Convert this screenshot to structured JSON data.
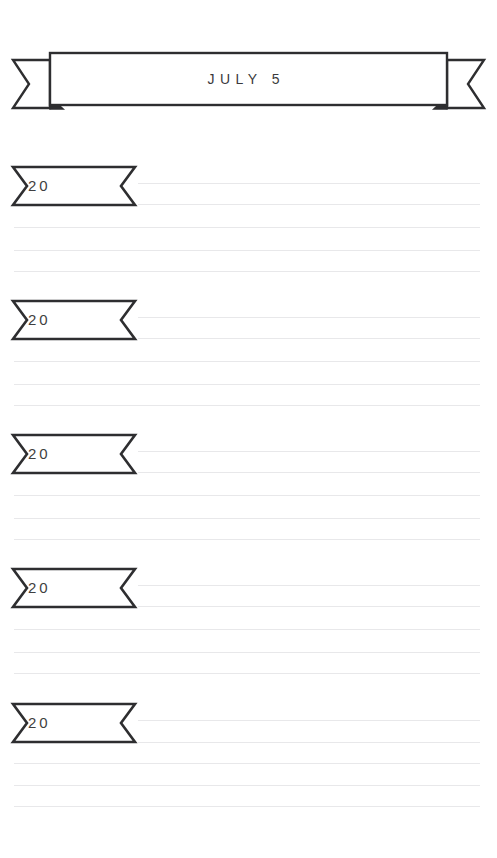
{
  "page": {
    "background_color": "#ffffff",
    "ink_color": "#2e2e30",
    "rule_color": "#e8e8ea",
    "width": 497,
    "height": 858
  },
  "header": {
    "title": "JULY 5",
    "icon": "ribbon-banner-icon",
    "shape": "swallowtail-ribbon"
  },
  "entries": [
    {
      "year_prefix": "20",
      "icon": "ribbon-tag-icon",
      "top": 165,
      "rules": [
        {
          "y": 18,
          "style": "indented"
        },
        {
          "y": 39,
          "style": "indented"
        },
        {
          "y": 62,
          "style": "full"
        },
        {
          "y": 85,
          "style": "full"
        },
        {
          "y": 106,
          "style": "full"
        }
      ]
    },
    {
      "year_prefix": "20",
      "icon": "ribbon-tag-icon",
      "top": 299,
      "rules": [
        {
          "y": 18,
          "style": "indented"
        },
        {
          "y": 39,
          "style": "indented"
        },
        {
          "y": 62,
          "style": "full"
        },
        {
          "y": 85,
          "style": "full"
        },
        {
          "y": 106,
          "style": "full"
        }
      ]
    },
    {
      "year_prefix": "20",
      "icon": "ribbon-tag-icon",
      "top": 433,
      "rules": [
        {
          "y": 18,
          "style": "indented"
        },
        {
          "y": 39,
          "style": "indented"
        },
        {
          "y": 62,
          "style": "full"
        },
        {
          "y": 85,
          "style": "full"
        },
        {
          "y": 106,
          "style": "full"
        }
      ]
    },
    {
      "year_prefix": "20",
      "icon": "ribbon-tag-icon",
      "top": 567,
      "rules": [
        {
          "y": 18,
          "style": "indented"
        },
        {
          "y": 39,
          "style": "indented"
        },
        {
          "y": 62,
          "style": "full"
        },
        {
          "y": 85,
          "style": "full"
        },
        {
          "y": 106,
          "style": "full"
        }
      ]
    },
    {
      "year_prefix": "20",
      "icon": "ribbon-tag-icon",
      "top": 702,
      "rules": [
        {
          "y": 18,
          "style": "indented"
        },
        {
          "y": 40,
          "style": "indented"
        },
        {
          "y": 61,
          "style": "full"
        },
        {
          "y": 83,
          "style": "full"
        },
        {
          "y": 104,
          "style": "full"
        }
      ]
    }
  ]
}
